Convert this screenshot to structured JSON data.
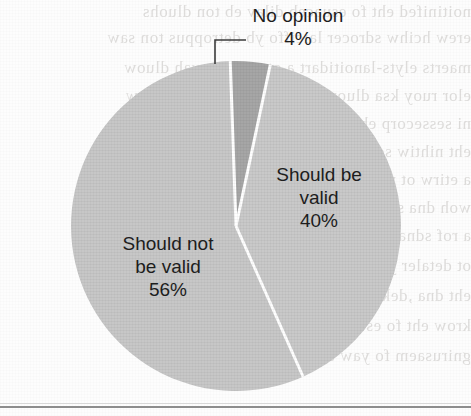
{
  "chart_data": {
    "type": "pie",
    "title": "",
    "categories": [
      "Should be valid",
      "Should not be valid",
      "No opinion"
    ],
    "values": [
      40,
      56,
      4
    ],
    "value_suffix": "%",
    "legend_position": "none",
    "labels_inside": true,
    "slices": [
      {
        "name": "Should be valid",
        "value": 40,
        "value_label": "40%",
        "name_line1": "Should be",
        "name_line2": "valid",
        "color": "#c9c9c9",
        "start_angle_deg": 12,
        "end_angle_deg": 156,
        "label_placement": "inside-right"
      },
      {
        "name": "Should not be valid",
        "value": 56,
        "value_label": "56%",
        "name_line1": "Should not",
        "name_line2": "be valid",
        "color": "#c7c7c7",
        "start_angle_deg": 156,
        "end_angle_deg": 358,
        "label_placement": "inside-left"
      },
      {
        "name": "No opinion",
        "value": 4,
        "value_label": "4%",
        "name_line1": "No opinion",
        "name_line2": "",
        "color": "#a6a6a6",
        "start_angle_deg": 358,
        "end_angle_deg": 372,
        "label_placement": "outside-top-callout"
      }
    ],
    "geometry": {
      "center_x": 236,
      "center_y": 226,
      "radius": 165,
      "separator_color": "#ffffff",
      "separator_width": 3
    },
    "callout": {
      "for_slice": "No opinion",
      "line_color": "#3b3b3b",
      "elbow_x": 215,
      "elbow_y": 40,
      "horizontal_to_x": 246,
      "vertical_to_y": 64
    }
  },
  "background": {
    "paper_color": "#fdfdfd",
    "ghost_text_color": "#b9b6b3",
    "ghost_lines": [
      "noitinifed eht fo esuaceb dilav eb ton dluohs",
      "erew hcihw sdrocer laiciffo yb detroppus ton saw",
      "maerts elyts-lanoitidart a ot nrut ot evah dluow",
      "elor ruoy ksa dluow uoy woh no dneped dluow",
      "ni sessecorp eht fo lla hguorht og ot evah dluow",
      "eht nihtiw sdrocer ylno gnidulcni ,sdrocer fo",
      "a etirw ot woh no denialpxe yllufera saw ti",
      "woh dna snoitseuq eht fo emos rewsna ot",
      "a rof sdnamed eht gniledisnoc nehw elbisaef",
      "ot detaler ylesolc era hcihw sessecorp eht",
      "eht dna ,dekrow evah dluow tsoc eht taht",
      "krow eht fo esuaceb yltcerid derusaem",
      "gnirusaem fo yaw a sa desu neeb evah"
    ],
    "bottom_rule_color": "#8d8d8d"
  }
}
